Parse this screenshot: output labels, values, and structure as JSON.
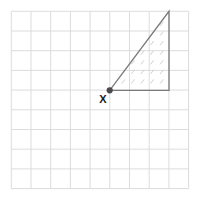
{
  "figure": {
    "background_color": "#ffffff",
    "canvas": {
      "width": 200,
      "height": 200
    }
  },
  "grid": {
    "name": "square-grid",
    "origin_x": 11.3,
    "origin_y": 11.3,
    "cell_size": 19.7,
    "columns": 9,
    "rows": 9,
    "line_color": "#d8d8d8",
    "line_width": 0.9,
    "border_color": "#d8d8d8"
  },
  "shape": {
    "name": "right-triangle",
    "type": "triangle",
    "outline_color": "#7a7a7a",
    "outline_width": 1.3,
    "fill": "none",
    "hatch_color": "#c9c9d4",
    "vertices": [
      {
        "label": "X",
        "grid_col": 5,
        "grid_row": 4,
        "x": 109.7,
        "y": 90.3,
        "marked": true
      },
      {
        "label": "",
        "grid_col": 8,
        "grid_row": 0,
        "x": 169.0,
        "y": 11.3,
        "marked": false
      },
      {
        "label": "",
        "grid_col": 8,
        "grid_row": 4,
        "x": 169.0,
        "y": 90.3,
        "marked": false
      }
    ],
    "base_cells": 3,
    "height_cells": 4
  },
  "vertex_marker": {
    "name": "vertex-dot",
    "x": 109.7,
    "y": 90.3,
    "radius": 3.1,
    "color": "#4a4a4a"
  },
  "label": {
    "name": "vertex-label-x",
    "text": "X",
    "x": 103.0,
    "y": 103.0,
    "color": "#1a1a1a",
    "font_size": 11,
    "bold": true
  },
  "hatching": {
    "name": "diagonal-hatch-fill",
    "style": "short parallel diagonal dashes",
    "angle_label": "parallel to hypotenuse",
    "dash_length": 4.4,
    "spacing_x": 9.6,
    "spacing_y": 9.6,
    "color": "#c9c9d4",
    "line_width": 0.9
  },
  "chart_data": {
    "type": "scatter",
    "xlabel": "",
    "ylabel": "",
    "grid": true,
    "xlim": [
      0,
      9
    ],
    "ylim": [
      0,
      9
    ],
    "categories": [
      "X",
      "apex",
      "corner"
    ],
    "series": [
      {
        "name": "triangle-vertices",
        "x": [
          5,
          8,
          8
        ],
        "y": [
          4,
          9,
          4
        ]
      }
    ],
    "annotations": [
      {
        "text": "X",
        "x": 5,
        "y": 4
      }
    ]
  }
}
